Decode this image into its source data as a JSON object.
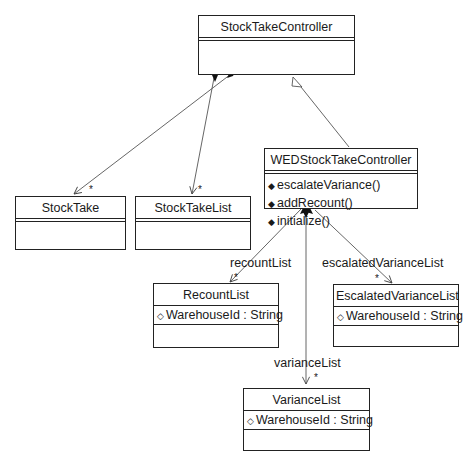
{
  "diagram": {
    "type": "UML class diagram",
    "classes": {
      "stock_take_controller": {
        "name": "StockTakeController"
      },
      "wed_stock_take_controller": {
        "name": "WEDStockTakeController",
        "operations": [
          "escalateVariance()",
          "addRecount()",
          "initialize()"
        ]
      },
      "stock_take": {
        "name": "StockTake"
      },
      "stock_take_list": {
        "name": "StockTakeList"
      },
      "recount_list": {
        "name": "RecountList",
        "attributes": [
          "WarehouseId : String"
        ]
      },
      "escalated_variance_list": {
        "name": "EscalatedVarianceList",
        "attributes": [
          "WarehouseId : String"
        ]
      },
      "variance_list": {
        "name": "VarianceList",
        "attributes": [
          "WarehouseId : String"
        ]
      }
    },
    "relations": {
      "recount_role": "recountList",
      "escalated_role": "escalatedVarianceList",
      "variance_role": "varianceList",
      "multiplicity": "*"
    },
    "icons": {
      "operation": "◆",
      "attribute": "◇"
    }
  }
}
